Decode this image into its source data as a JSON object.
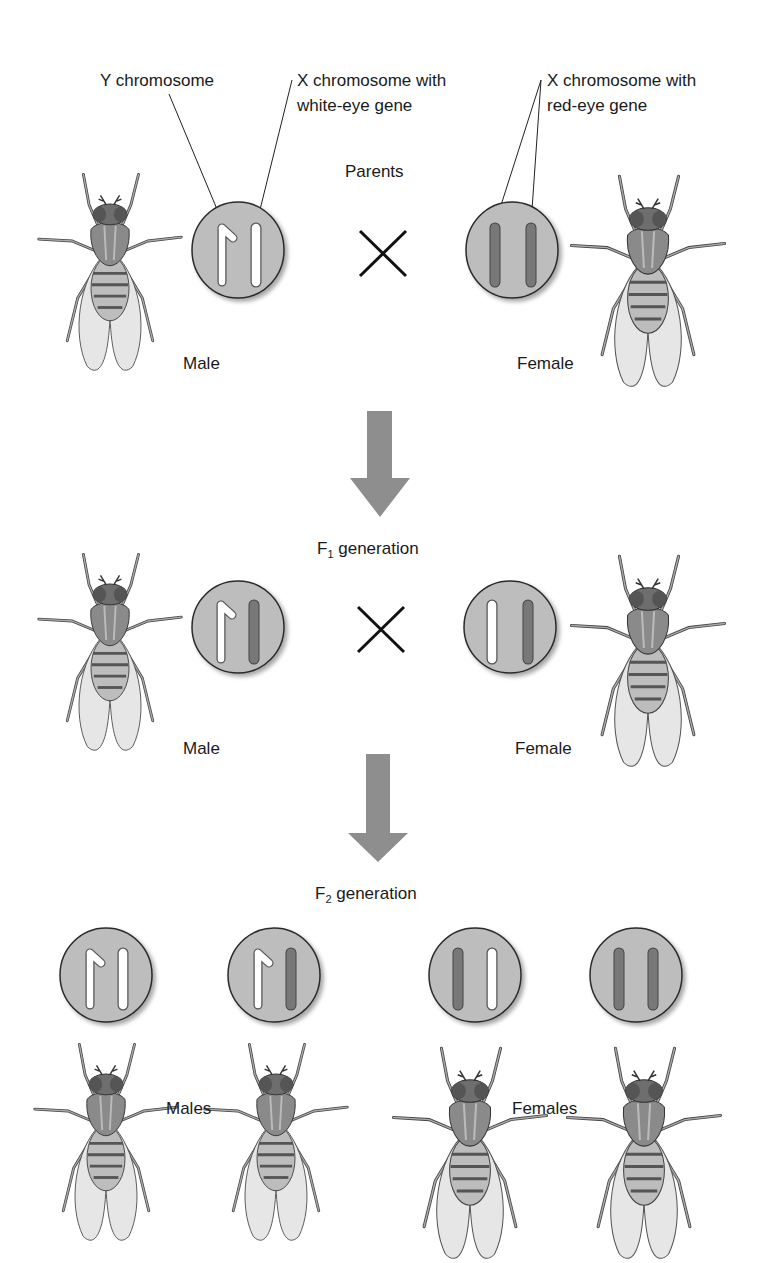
{
  "labels": {
    "y_chromosome": "Y chromosome",
    "x_white_line1": "X chromosome with",
    "x_white_line2": "white-eye gene",
    "x_red_line1": "X chromosome with",
    "x_red_line2": "red-eye gene",
    "parents": "Parents",
    "parents_male": "Male",
    "parents_female": "Female",
    "f1_prefix": "F",
    "f1_sub": "1",
    "f1_suffix": " generation",
    "f1_male": "Male",
    "f1_female": "Female",
    "f2_prefix": "F",
    "f2_sub": "2",
    "f2_suffix": " generation",
    "f2_males": "Males",
    "f2_females": "Females"
  },
  "colors": {
    "circle_fill": "#bdbdbd",
    "circle_stroke": "#2b2b2b",
    "white_chromosome": "#ffffff",
    "red_eye_chromosome": "#787878",
    "arrow": "#8e8e8e",
    "cross": "#111111"
  },
  "generations": [
    {
      "name": "Parents",
      "individuals": [
        {
          "sex": "Male",
          "chromosomes": [
            "Y",
            "X-white"
          ]
        },
        {
          "sex": "Female",
          "chromosomes": [
            "X-red",
            "X-red"
          ]
        }
      ]
    },
    {
      "name": "F1 generation",
      "individuals": [
        {
          "sex": "Male",
          "chromosomes": [
            "Y",
            "X-red"
          ]
        },
        {
          "sex": "Female",
          "chromosomes": [
            "X-white",
            "X-red"
          ]
        }
      ]
    },
    {
      "name": "F2 generation",
      "individuals": [
        {
          "sex": "Male",
          "chromosomes": [
            "Y",
            "X-white"
          ]
        },
        {
          "sex": "Male",
          "chromosomes": [
            "Y",
            "X-red"
          ]
        },
        {
          "sex": "Female",
          "chromosomes": [
            "X-red",
            "X-white"
          ]
        },
        {
          "sex": "Female",
          "chromosomes": [
            "X-red",
            "X-red"
          ]
        }
      ]
    }
  ]
}
